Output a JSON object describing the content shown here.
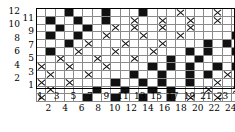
{
  "chart_data": {
    "type": "heatmap",
    "title": "",
    "xlabel": "",
    "ylabel": "",
    "columns": 24,
    "rows": 12,
    "x_tick_labels": [
      "1",
      "2",
      "3",
      "4",
      "5",
      "6",
      "7",
      "8",
      "9",
      "10",
      "11",
      "12",
      "13",
      "14",
      "15",
      "16",
      "17",
      "18",
      "19",
      "20",
      "21",
      "22",
      "23",
      "24"
    ],
    "y_tick_labels": [
      "1",
      "2",
      "3",
      "4",
      "5",
      "6",
      "7",
      "8",
      "9",
      "10",
      "11",
      "12"
    ],
    "x_tick_label_stagger": "odd-above-even-below",
    "y_tick_label_stagger": "even-outer-odd-inner",
    "legend": [],
    "grid": true,
    "cell_states": [
      "empty",
      "filled",
      "crossed"
    ],
    "state_colors": {
      "empty": "#ffffff",
      "filled": "#111111",
      "crossed": "#ffffff",
      "gridline": "#8a8a8a",
      "frame": "#000000"
    },
    "row_order_top_to_bottom": [
      12,
      11,
      10,
      9,
      8,
      7,
      6,
      5,
      4,
      3,
      2,
      1
    ],
    "cells": [
      [
        "e",
        "e",
        "e",
        "f",
        "e",
        "e",
        "e",
        "f",
        "e",
        "e",
        "e",
        "f",
        "e",
        "e",
        "e",
        "x",
        "e",
        "e",
        "e",
        "x",
        "e",
        "e",
        "e",
        "x"
      ],
      [
        "e",
        "f",
        "e",
        "e",
        "f",
        "e",
        "e",
        "f",
        "e",
        "e",
        "x",
        "e",
        "e",
        "x",
        "e",
        "e",
        "x",
        "e",
        "e",
        "x",
        "e",
        "e",
        "x",
        "e"
      ],
      [
        "e",
        "e",
        "f",
        "e",
        "e",
        "f",
        "e",
        "e",
        "x",
        "e",
        "x",
        "e",
        "e",
        "x",
        "e",
        "e",
        "x",
        "e",
        "e",
        "e",
        "e",
        "e",
        "e",
        "f"
      ],
      [
        "e",
        "f",
        "e",
        "e",
        "f",
        "e",
        "e",
        "x",
        "e",
        "e",
        "e",
        "x",
        "e",
        "e",
        "e",
        "x",
        "e",
        "e",
        "e",
        "e",
        "e",
        "f",
        "e",
        "e"
      ],
      [
        "e",
        "e",
        "e",
        "f",
        "e",
        "x",
        "e",
        "e",
        "e",
        "x",
        "e",
        "e",
        "e",
        "x",
        "e",
        "e",
        "e",
        "e",
        "f",
        "e",
        "f",
        "e",
        "e",
        "f"
      ],
      [
        "e",
        "f",
        "e",
        "e",
        "x",
        "e",
        "e",
        "e",
        "x",
        "e",
        "e",
        "e",
        "x",
        "e",
        "e",
        "e",
        "f",
        "e",
        "f",
        "e",
        "e",
        "f",
        "e",
        "e"
      ],
      [
        "e",
        "e",
        "x",
        "e",
        "e",
        "e",
        "x",
        "e",
        "e",
        "e",
        "x",
        "e",
        "e",
        "e",
        "f",
        "e",
        "e",
        "f",
        "e",
        "e",
        "e",
        "e",
        "f",
        "e"
      ],
      [
        "x",
        "e",
        "e",
        "x",
        "e",
        "e",
        "e",
        "x",
        "e",
        "e",
        "e",
        "e",
        "f",
        "e",
        "f",
        "e",
        "f",
        "e",
        "e",
        "f",
        "e",
        "f",
        "e",
        "e"
      ],
      [
        "e",
        "x",
        "e",
        "e",
        "e",
        "x",
        "e",
        "e",
        "e",
        "e",
        "f",
        "e",
        "e",
        "f",
        "e",
        "e",
        "f",
        "e",
        "f",
        "e",
        "x",
        "e",
        "e",
        "x"
      ],
      [
        "x",
        "e",
        "e",
        "x",
        "e",
        "e",
        "e",
        "e",
        "f",
        "e",
        "e",
        "f",
        "e",
        "f",
        "e",
        "e",
        "f",
        "e",
        "e",
        "x",
        "e",
        "e",
        "x",
        "e"
      ],
      [
        "e",
        "x",
        "e",
        "e",
        "e",
        "e",
        "f",
        "e",
        "e",
        "f",
        "e",
        "e",
        "f",
        "e",
        "f",
        "e",
        "e",
        "e",
        "x",
        "e",
        "e",
        "x",
        "e",
        "e"
      ],
      [
        "x",
        "e",
        "e",
        "e",
        "e",
        "f",
        "e",
        "e",
        "f",
        "e",
        "e",
        "f",
        "e",
        "e",
        "f",
        "e",
        "x",
        "e",
        "e",
        "x",
        "e",
        "e",
        "e",
        "x"
      ]
    ]
  }
}
